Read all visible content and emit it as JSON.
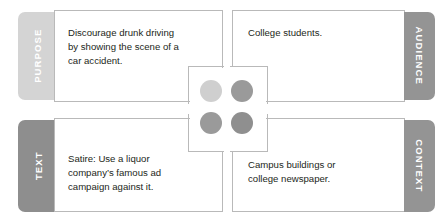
{
  "diagram": {
    "type": "rhetorical-situation-quadrant",
    "background": "#ffffff",
    "border_color": "#b9b9b9",
    "text_color": "#231f20",
    "quadrants": [
      {
        "id": "purpose",
        "tab_label": "PURPOSE",
        "tab_color": "#d4d4d4",
        "tab_side": "left",
        "tab_text_direction": "bottom-to-top",
        "body": "Discourage drunk driving\nby showing the scene of a\ncar accident.",
        "position": "top-left"
      },
      {
        "id": "audience",
        "tab_label": "AUDIENCE",
        "tab_color": "#949494",
        "tab_side": "right",
        "tab_text_direction": "top-to-bottom",
        "body": "College students.",
        "position": "top-right"
      },
      {
        "id": "text",
        "tab_label": "TEXT",
        "tab_color": "#8e8e8e",
        "tab_side": "left",
        "tab_text_direction": "bottom-to-top",
        "body": "Satire: Use a liquor\ncompany’s famous ad\ncampaign against it.",
        "position": "bottom-left"
      },
      {
        "id": "context",
        "tab_label": "CONTEXT",
        "tab_color": "#949494",
        "tab_side": "right",
        "tab_text_direction": "top-to-bottom",
        "body": "Campus buildings or\ncollege newspaper.",
        "position": "bottom-right"
      }
    ],
    "center_dots": [
      {
        "id": "dot-top-left",
        "color": "#cfcfcf"
      },
      {
        "id": "dot-top-right",
        "color": "#9a9a9a"
      },
      {
        "id": "dot-bottom-left",
        "color": "#9a9a9a"
      },
      {
        "id": "dot-bottom-right",
        "color": "#8f8f8f"
      }
    ]
  }
}
